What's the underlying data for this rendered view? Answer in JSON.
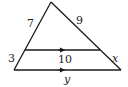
{
  "diagram": {
    "type": "triangle-with-parallel-segment",
    "colors": {
      "stroke": "#1a1a1a",
      "text": "#222222",
      "background": "#ffffff"
    },
    "labels": {
      "upper_left_side": "7",
      "upper_right_side": "9",
      "lower_left_side": "3",
      "lower_right_side": "x",
      "parallel_segment": "10",
      "base": "y"
    },
    "points": {
      "apex": [
        51,
        2
      ],
      "base_left": [
        14,
        70
      ],
      "base_right": [
        121,
        70
      ],
      "mid_left": [
        25,
        50
      ],
      "mid_right": [
        100,
        50
      ]
    }
  }
}
